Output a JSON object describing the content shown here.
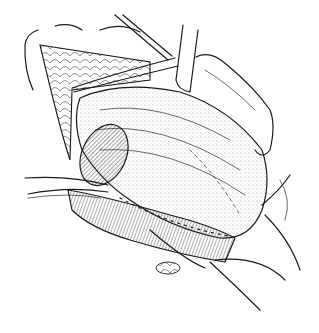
{
  "illustration": {
    "subject": "surgical line drawing",
    "style": "black ink stipple and hatching on white",
    "colors": {
      "ink": "#1a1a1a",
      "background": "#ffffff",
      "stipple": "#555555"
    },
    "elements": [
      "retracted skin flap",
      "retractor blades",
      "stippled organ with sutures",
      "rounded pouch",
      "hatched muscle band",
      "tube",
      "forceps"
    ]
  }
}
